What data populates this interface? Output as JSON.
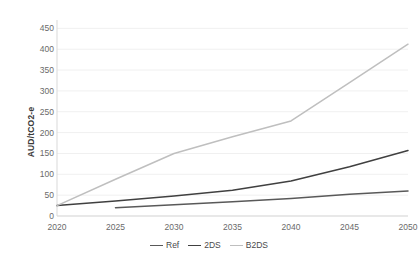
{
  "chart_data": {
    "type": "line",
    "title": "",
    "xlabel": "",
    "ylabel": "AUD/tCO2-e",
    "x": [
      2020,
      2025,
      2030,
      2035,
      2040,
      2045,
      2050
    ],
    "xtick_labels": [
      "2020",
      "2025",
      "2030",
      "2035",
      "2040",
      "2045",
      "2050"
    ],
    "ytick_labels": [
      "0",
      "50",
      "100",
      "150",
      "200",
      "250",
      "300",
      "350",
      "400",
      "450"
    ],
    "yticks": [
      0,
      50,
      100,
      150,
      200,
      250,
      300,
      350,
      400,
      450
    ],
    "ylim": [
      0,
      470
    ],
    "xlim": [
      2020,
      2050
    ],
    "grid": "horizontal",
    "legend_position": "bottom-center",
    "series": [
      {
        "name": "Ref",
        "color": "#595959",
        "x": [
          2025,
          2030,
          2035,
          2040,
          2045,
          2050
        ],
        "values": [
          20,
          27,
          34,
          42,
          52,
          60
        ]
      },
      {
        "name": "2DS",
        "color": "#404040",
        "x": [
          2020,
          2025,
          2030,
          2035,
          2040,
          2045,
          2050
        ],
        "values": [
          25,
          36,
          48,
          62,
          84,
          118,
          157
        ]
      },
      {
        "name": "B2DS",
        "color": "#bfbfbf",
        "x": [
          2020,
          2025,
          2030,
          2035,
          2040,
          2045,
          2050
        ],
        "values": [
          25,
          88,
          150,
          190,
          228,
          320,
          412
        ]
      }
    ]
  },
  "legend": {
    "items": [
      {
        "label": "Ref",
        "color": "#595959"
      },
      {
        "label": "2DS",
        "color": "#404040"
      },
      {
        "label": "B2DS",
        "color": "#bfbfbf"
      }
    ]
  }
}
